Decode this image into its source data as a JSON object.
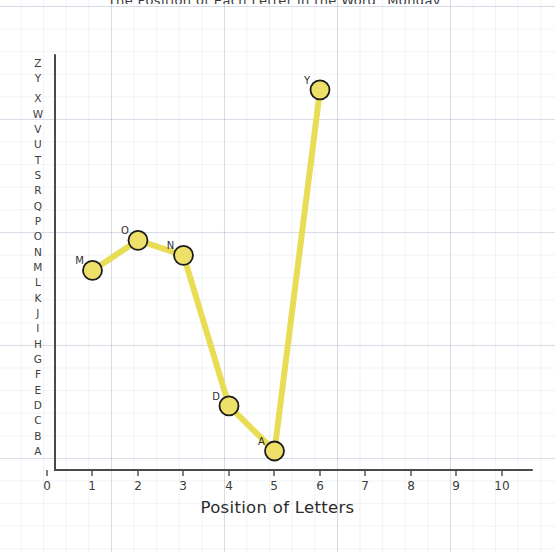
{
  "chart_data": {
    "type": "line",
    "title": "The Position of Each Letter in the Word \"Monday\"",
    "xlabel": "Position of Letters",
    "ylabel": "",
    "x": [
      1,
      2,
      3,
      4,
      5,
      6
    ],
    "point_labels": [
      "M",
      "O",
      "N",
      "D",
      "A",
      "Y"
    ],
    "values": [
      13,
      15,
      14,
      4,
      1,
      25
    ],
    "y_tick_labels": [
      "A",
      "B",
      "C",
      "D",
      "E",
      "F",
      "G",
      "H",
      "I",
      "J",
      "K",
      "L",
      "M",
      "N",
      "O",
      "P",
      "Q",
      "R",
      "S",
      "T",
      "U",
      "V",
      "W",
      "X",
      "Y",
      "Z"
    ],
    "x_tick_labels": [
      "0",
      "1",
      "2",
      "3",
      "4",
      "5",
      "6",
      "7",
      "8",
      "9",
      "10"
    ],
    "xlim": [
      0,
      10
    ],
    "ylim": [
      0,
      26
    ],
    "grid": true,
    "legend": "none",
    "series": [
      {
        "name": "Monday",
        "points": [
          {
            "x": 1,
            "label": "M",
            "letter_value": 13
          },
          {
            "x": 2,
            "label": "O",
            "letter_value": 15
          },
          {
            "x": 3,
            "label": "N",
            "letter_value": 14
          },
          {
            "x": 4,
            "label": "D",
            "letter_value": 4
          },
          {
            "x": 5,
            "label": "A",
            "letter_value": 1
          },
          {
            "x": 6,
            "label": "Y",
            "letter_value": 25
          }
        ]
      }
    ],
    "colors": {
      "line": "#e8dd55",
      "marker_fill": "#efe06a",
      "marker_edge": "#1c1c1c",
      "axis": "#4a4a4a",
      "grid": "#b8c4d6",
      "text": "#3d3d3d",
      "background": "#ffffff"
    }
  }
}
